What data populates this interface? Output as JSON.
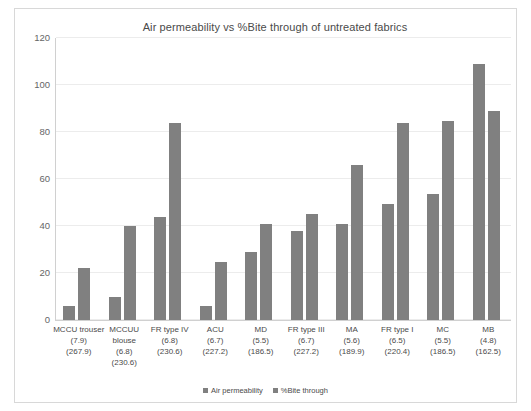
{
  "chart_data": {
    "type": "bar",
    "title": "Air permeability vs %Bite through of untreated fabrics",
    "xlabel": "",
    "ylabel": "Air permeability (CFM) / %Bite through",
    "ylim": [
      0,
      120
    ],
    "yticks": [
      0,
      20,
      40,
      60,
      80,
      100,
      120
    ],
    "grid": true,
    "legend_position": "bottom",
    "categories": [
      "MCCU trouser",
      "MCCUU blouse",
      "FR type IV",
      "ACU",
      "MD",
      "FR type III",
      "MA",
      "FR type I",
      "MC",
      "MB"
    ],
    "category_labels": [
      [
        "MCCU trouser",
        "(7.9)",
        "(267.9)"
      ],
      [
        "MCCUU",
        "blouse",
        "(6.8)",
        "(230.6)"
      ],
      [
        "FR type IV",
        "(6.8)",
        "(230.6)"
      ],
      [
        "ACU",
        "(6.7)",
        "(227.2)"
      ],
      [
        "MD",
        "(5.5)",
        "(186.5)"
      ],
      [
        "FR type III",
        "(6.7)",
        "(227.2)"
      ],
      [
        "MA",
        "(5.6)",
        "(189.9)"
      ],
      [
        "FR type I",
        "(6.5)",
        "(220.4)"
      ],
      [
        "MC",
        "(5.5)",
        "(186.5)"
      ],
      [
        "MB",
        "(4.8)",
        "(162.5)"
      ]
    ],
    "series": [
      {
        "name": "Air permeability",
        "color": "#808080",
        "values": [
          6,
          10,
          44,
          6,
          29,
          38,
          41,
          49.5,
          53.5,
          109
        ]
      },
      {
        "name": "%Bite through",
        "color": "#808080",
        "values": [
          22,
          40,
          84,
          24.5,
          41,
          45,
          66,
          84,
          84.5,
          89
        ]
      }
    ]
  },
  "colors": {
    "bar": "#808080",
    "gridline": "#ececec",
    "axis": "#d0d0d0",
    "text": "#4a4a4a",
    "frame": "#d8d8d8"
  }
}
